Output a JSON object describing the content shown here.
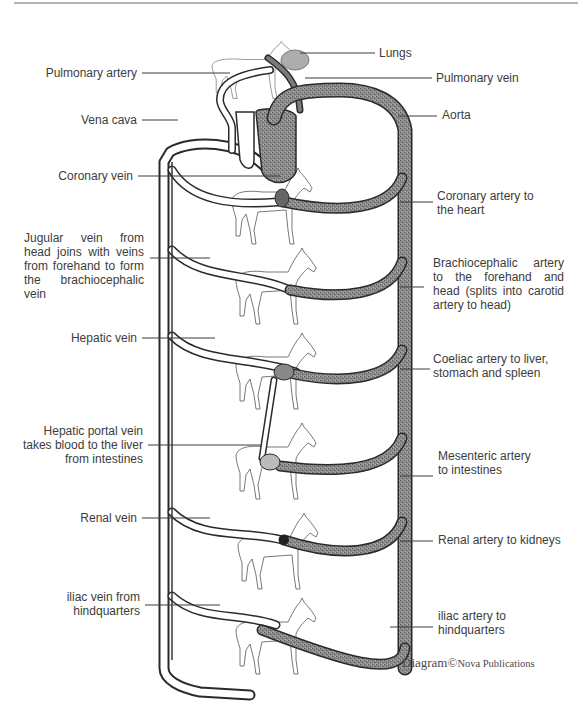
{
  "diagram": {
    "colors": {
      "artery_fill": "#7a7a7a",
      "vein_fill": "#ffffff",
      "outline": "#2a2a2a",
      "leader_line": "#3a3a3a",
      "text": "#3c3c3c",
      "top_rule": "#6a6a6a"
    },
    "labels_left": {
      "pulmonary_artery": "Pulmonary artery",
      "vena_cava": "Vena cava",
      "coronary_vein": "Coronary vein",
      "jugular_vein": "Jugular vein from head joins with veins from forehand to form the brachiocephalic vein",
      "hepatic_vein": "Hepatic vein",
      "hepatic_portal_l1": "Hepatic portal vein",
      "hepatic_portal_l2": "takes blood to the liver",
      "hepatic_portal_l3": "from intestines",
      "renal_vein": "Renal vein",
      "iliac_vein_l1": "iliac vein from",
      "iliac_vein_l2": "hindquarters"
    },
    "labels_right": {
      "lungs": "Lungs",
      "pulmonary_vein": "Pulmonary vein",
      "aorta": "Aorta",
      "coronary_artery_l1": "Coronary artery to",
      "coronary_artery_l2": "the heart",
      "brachiocephalic_artery": "Brachiocephalic artery to the forehand and head (splits into carotid artery to head)",
      "coeliac_artery_l1": "Coeliac artery to liver,",
      "coeliac_artery_l2": "stomach and spleen",
      "mesenteric_artery_l1": "Mesenteric artery",
      "mesenteric_artery_l2": "to intestines",
      "renal_artery": "Renal artery to kidneys",
      "iliac_artery_l1": "iliac artery to",
      "iliac_artery_l2": "hindquarters"
    },
    "credit": {
      "prefix": "Diagram",
      "symbol": "©",
      "publisher": "Nova Publications"
    },
    "sections": [
      "lungs",
      "heart",
      "coronary",
      "forehand-head",
      "liver-stomach-spleen",
      "intestines",
      "kidneys",
      "hindquarters"
    ]
  }
}
